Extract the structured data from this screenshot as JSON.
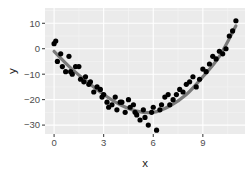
{
  "chart_data": {
    "type": "scatter",
    "title": "",
    "xlabel": "x",
    "ylabel": "y",
    "xlim": [
      -0.55,
      11.55
    ],
    "ylim": [
      -33.5,
      16
    ],
    "x_ticks": [
      0,
      3,
      6,
      9
    ],
    "y_ticks": [
      10,
      0,
      -10,
      -20,
      -30
    ],
    "x_tick_labels": [
      "0",
      "3",
      "6",
      "9"
    ],
    "y_tick_labels": [
      "10",
      "0",
      "-10",
      "-20",
      "-30"
    ],
    "grid": true,
    "legend": null,
    "theme": {
      "panel_bg": "#ebebeb",
      "grid_major": "#ffffff",
      "grid_minor": "#f5f5f5",
      "point_color": "#000000",
      "smooth_color": "#666666"
    },
    "series": [
      {
        "name": "points",
        "kind": "scatter",
        "x": [
          0.0,
          0.1,
          0.2,
          0.4,
          0.5,
          0.7,
          0.9,
          1.0,
          1.1,
          1.3,
          1.5,
          1.6,
          1.8,
          1.9,
          2.1,
          2.2,
          2.4,
          2.6,
          2.8,
          2.9,
          3.0,
          3.2,
          3.3,
          3.5,
          3.7,
          3.8,
          4.0,
          4.1,
          4.3,
          4.5,
          4.6,
          4.8,
          4.9,
          5.0,
          5.2,
          5.4,
          5.5,
          5.7,
          5.9,
          6.0,
          6.2,
          6.4,
          6.5,
          6.7,
          6.9,
          7.0,
          7.2,
          7.4,
          7.6,
          7.8,
          8.0,
          8.2,
          8.4,
          8.6,
          8.8,
          9.0,
          9.2,
          9.4,
          9.6,
          9.8,
          10.0,
          10.2,
          10.4,
          10.6,
          10.8,
          11.0
        ],
        "y": [
          2,
          3,
          -5,
          -2,
          -7,
          -9,
          -3,
          -9,
          -10,
          -7,
          -7,
          -12,
          -13,
          -11,
          -14,
          -13,
          -17,
          -15,
          -16,
          -19,
          -18,
          -21,
          -23,
          -22,
          -19,
          -24,
          -21,
          -21,
          -25,
          -20,
          -23,
          -22,
          -25,
          -26,
          -28,
          -24,
          -27,
          -30,
          -25,
          -23,
          -32,
          -24,
          -22,
          -19,
          -18,
          -22,
          -20,
          -18,
          -16,
          -17,
          -14,
          -13,
          -11,
          -15,
          -12,
          -8,
          -9,
          -6,
          -3,
          -4,
          -1,
          -2,
          0,
          5,
          7,
          11
        ]
      },
      {
        "name": "smooth",
        "kind": "line",
        "x": [
          0,
          1,
          2,
          3,
          4,
          5,
          6,
          7,
          8,
          9,
          10,
          11
        ],
        "y": [
          -1,
          -7.5,
          -13,
          -18,
          -22,
          -24.5,
          -25,
          -22.5,
          -18,
          -11,
          -3,
          9
        ]
      }
    ]
  }
}
